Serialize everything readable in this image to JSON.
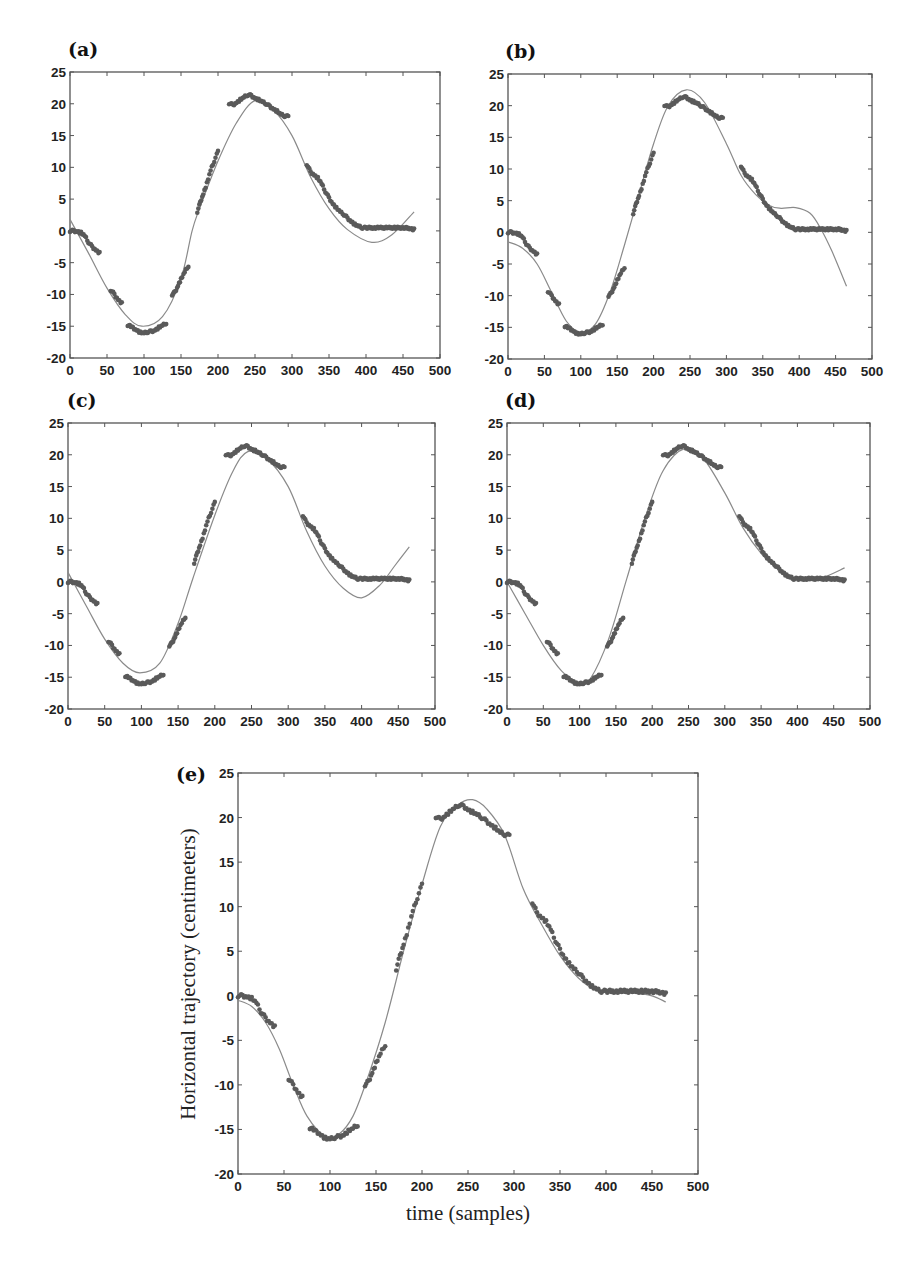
{
  "figure": {
    "background": "#ffffff",
    "marker_color": "#5a5a5a",
    "fit_line_color": "#8a8a8a",
    "axis_color": "#555555",
    "panels_layout": [
      {
        "id": "a",
        "label": "(a)",
        "box": [
          70,
          72,
          440,
          358
        ],
        "label_pos": [
          68,
          56
        ]
      },
      {
        "id": "b",
        "label": "(b)",
        "box": [
          508,
          74,
          872,
          359
        ],
        "label_pos": [
          505,
          58
        ]
      },
      {
        "id": "c",
        "label": "(c)",
        "box": [
          68,
          423,
          435,
          709
        ],
        "label_pos": [
          67,
          407
        ]
      },
      {
        "id": "d",
        "label": "(d)",
        "box": [
          507,
          423,
          870,
          709
        ],
        "label_pos": [
          505,
          407
        ]
      },
      {
        "id": "e",
        "label": "(e)",
        "box": [
          238,
          773,
          698,
          1174
        ],
        "label_pos": [
          176,
          781
        ]
      }
    ],
    "xlabel_e": "time (samples)",
    "ylabel_e": "Horizontal trajectory (centimeters)"
  },
  "chart_data": [
    {
      "type": "scatter+line",
      "panel": "(a)",
      "title": "",
      "xlabel": "",
      "ylabel": "",
      "xlim": [
        0,
        500
      ],
      "ylim": [
        -20,
        25
      ],
      "xticks": [
        0,
        50,
        100,
        150,
        200,
        250,
        300,
        350,
        400,
        450,
        500
      ],
      "yticks": [
        -20,
        -15,
        -10,
        -5,
        0,
        5,
        10,
        15,
        20,
        25
      ],
      "grid": false,
      "series": [
        {
          "name": "measured",
          "style": "markers",
          "segments": [
            {
              "x": [
                0,
                5,
                10,
                15,
                20,
                25,
                30,
                35,
                40
              ],
              "y": [
                0,
                0,
                -0.1,
                -0.3,
                -0.8,
                -1.8,
                -2.5,
                -3.0,
                -3.5
              ]
            },
            {
              "x": [
                55,
                60,
                65,
                70
              ],
              "y": [
                -9.3,
                -10.0,
                -10.8,
                -11.4
              ]
            },
            {
              "x": [
                78,
                85,
                90,
                95,
                100,
                105,
                110,
                115,
                120,
                125,
                130
              ],
              "y": [
                -14.8,
                -15.2,
                -15.6,
                -16.0,
                -16.1,
                -15.9,
                -15.8,
                -15.6,
                -15.2,
                -14.9,
                -14.5
              ]
            },
            {
              "x": [
                138,
                142,
                146,
                150,
                155,
                160
              ],
              "y": [
                -10.0,
                -9.6,
                -8.6,
                -7.6,
                -6.5,
                -5.5
              ]
            },
            {
              "x": [
                172,
                176,
                180,
                185,
                190,
                195,
                200
              ],
              "y": [
                3.0,
                4.5,
                5.8,
                7.5,
                9.5,
                11.0,
                12.5
              ]
            },
            {
              "x": [
                215,
                220,
                225,
                230,
                235,
                240,
                245,
                250,
                255,
                260,
                265,
                270,
                275,
                280,
                285,
                290,
                295
              ],
              "y": [
                20.1,
                19.8,
                20.2,
                20.6,
                21.0,
                21.4,
                21.3,
                20.9,
                20.6,
                20.3,
                20.0,
                19.6,
                19.2,
                18.8,
                18.3,
                18.1,
                18.0
              ]
            },
            {
              "x": [
                320,
                325,
                330,
                335,
                340,
                345,
                350,
                355,
                360,
                365,
                370,
                375,
                380,
                385,
                390,
                395,
                400,
                410,
                420,
                430,
                440,
                450,
                460,
                465
              ],
              "y": [
                10.5,
                9.3,
                8.8,
                8.3,
                7.4,
                6.2,
                5.2,
                4.3,
                3.6,
                3.0,
                2.6,
                2.0,
                1.5,
                1.0,
                0.7,
                0.5,
                0.5,
                0.5,
                0.5,
                0.5,
                0.5,
                0.5,
                0.4,
                0.2
              ]
            }
          ]
        },
        {
          "name": "fit",
          "style": "line",
          "x": [
            0,
            25,
            50,
            75,
            97,
            125,
            150,
            165,
            175,
            200,
            225,
            250,
            275,
            300,
            325,
            350,
            375,
            408,
            435,
            465
          ],
          "y": [
            1.8,
            -3.5,
            -9.0,
            -13.2,
            -15.0,
            -13.5,
            -7.5,
            0.0,
            3.5,
            11.0,
            17.0,
            20.5,
            19.0,
            15.0,
            8.5,
            3.5,
            0.2,
            -1.8,
            -0.6,
            3.0
          ]
        }
      ]
    },
    {
      "type": "scatter+line",
      "panel": "(b)",
      "xlim": [
        0,
        500
      ],
      "ylim": [
        -20,
        25
      ],
      "xticks": [
        0,
        50,
        100,
        150,
        200,
        250,
        300,
        350,
        400,
        450,
        500
      ],
      "yticks": [
        -20,
        -15,
        -10,
        -5,
        0,
        5,
        10,
        15,
        20,
        25
      ],
      "grid": false,
      "series": [
        {
          "name": "measured",
          "style": "markers",
          "same_as": "(a)"
        },
        {
          "name": "fit",
          "style": "line",
          "x": [
            0,
            20,
            40,
            60,
            80,
            100,
            120,
            140,
            160,
            180,
            200,
            220,
            245,
            270,
            300,
            320,
            340,
            360,
            375,
            395,
            415,
            430,
            445,
            465
          ],
          "y": [
            -1.5,
            -2.5,
            -5.0,
            -9.5,
            -14.0,
            -15.8,
            -14.5,
            -9.5,
            -2.0,
            6.0,
            14.0,
            20.0,
            22.5,
            20.5,
            14.0,
            9.0,
            6.0,
            4.2,
            3.8,
            3.9,
            3.0,
            0.5,
            -3.0,
            -8.5
          ]
        }
      ]
    },
    {
      "type": "scatter+line",
      "panel": "(c)",
      "xlim": [
        0,
        500
      ],
      "ylim": [
        -20,
        25
      ],
      "xticks": [
        0,
        50,
        100,
        150,
        200,
        250,
        300,
        350,
        400,
        450,
        500
      ],
      "yticks": [
        -20,
        -15,
        -10,
        -5,
        0,
        5,
        10,
        15,
        20,
        25
      ],
      "grid": false,
      "series": [
        {
          "name": "measured",
          "style": "markers",
          "same_as": "(a)"
        },
        {
          "name": "fit",
          "style": "line",
          "x": [
            0,
            25,
            50,
            75,
            98,
            125,
            150,
            170,
            200,
            225,
            245,
            270,
            300,
            325,
            350,
            375,
            400,
            425,
            445,
            465
          ],
          "y": [
            1.5,
            -3.8,
            -9.0,
            -12.8,
            -14.3,
            -12.8,
            -6.5,
            0.5,
            10.5,
            17.5,
            20.5,
            19.5,
            15.0,
            8.0,
            2.5,
            -1.0,
            -2.5,
            -0.5,
            2.5,
            5.5
          ]
        }
      ]
    },
    {
      "type": "scatter+line",
      "panel": "(d)",
      "xlim": [
        0,
        500
      ],
      "ylim": [
        -20,
        25
      ],
      "xticks": [
        0,
        50,
        100,
        150,
        200,
        250,
        300,
        350,
        400,
        450,
        500
      ],
      "yticks": [
        -20,
        -15,
        -10,
        -5,
        0,
        5,
        10,
        15,
        20,
        25
      ],
      "grid": false,
      "series": [
        {
          "name": "measured",
          "style": "markers",
          "same_as": "(a)"
        },
        {
          "name": "fit",
          "style": "line",
          "x": [
            0,
            25,
            50,
            75,
            100,
            115,
            140,
            165,
            190,
            215,
            245,
            270,
            300,
            325,
            350,
            375,
            400,
            430,
            465
          ],
          "y": [
            0.0,
            -5.0,
            -10.0,
            -14.0,
            -16.0,
            -15.2,
            -9.0,
            0.5,
            10.0,
            17.5,
            21.0,
            19.5,
            14.0,
            8.5,
            4.5,
            1.8,
            0.5,
            0.5,
            2.2
          ]
        }
      ]
    },
    {
      "type": "scatter+line",
      "panel": "(e)",
      "xlabel": "time (samples)",
      "ylabel": "Horizontal trajectory (centimeters)",
      "xlim": [
        0,
        500
      ],
      "ylim": [
        -20,
        25
      ],
      "xticks": [
        0,
        50,
        100,
        150,
        200,
        250,
        300,
        350,
        400,
        450,
        500
      ],
      "yticks": [
        -20,
        -15,
        -10,
        -5,
        0,
        5,
        10,
        15,
        20,
        25
      ],
      "grid": false,
      "series": [
        {
          "name": "measured",
          "style": "markers",
          "same_as": "(a)"
        },
        {
          "name": "fit",
          "style": "line",
          "x": [
            0,
            15,
            30,
            45,
            60,
            75,
            95,
            110,
            125,
            140,
            160,
            180,
            200,
            220,
            240,
            255,
            270,
            290,
            310,
            330,
            350,
            370,
            390,
            410,
            430,
            450,
            465
          ],
          "y": [
            -0.5,
            -1.2,
            -3.0,
            -6.0,
            -10.0,
            -13.5,
            -15.8,
            -15.5,
            -13.5,
            -9.5,
            -3.0,
            5.0,
            12.5,
            19.0,
            21.5,
            22.0,
            21.0,
            18.0,
            12.0,
            8.0,
            4.5,
            2.0,
            0.6,
            0.3,
            0.3,
            0.0,
            -0.7
          ]
        }
      ]
    }
  ]
}
